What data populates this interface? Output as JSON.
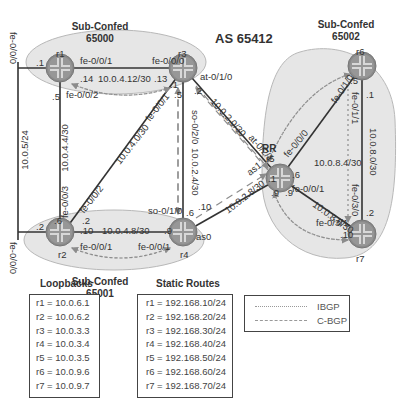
{
  "title": "AS 65412",
  "sub_confeds": [
    {
      "label": "Sub-Confed",
      "as": "65000"
    },
    {
      "label": "Sub-Confed",
      "as": "65001"
    },
    {
      "label": "Sub-Confed",
      "as": "65002"
    }
  ],
  "routers": [
    {
      "name": "r1"
    },
    {
      "name": "r2"
    },
    {
      "name": "r3"
    },
    {
      "name": "r4"
    },
    {
      "name": "r5",
      "role": "RR"
    },
    {
      "name": "r6"
    },
    {
      "name": "r7"
    }
  ],
  "links": {
    "shared": {
      "subnet": "10.0.5/24",
      "r1_if": "fe-0/0/0",
      "r2_if": "fe-0/0/0",
      "r1_host": ".1",
      "r2_host": ".2",
      "marker": "•"
    },
    "r1_r3": {
      "subnet": "10.0.4.12/30",
      "r1_if": "fe-0/0/1",
      "r3_if": "fe-0/0/0",
      "r1_host": ".14",
      "r3_host": ".13"
    },
    "r1_r2": {
      "subnet": "10.0.4.4/30",
      "r1_host": ".5",
      "r2_if": "fe-0/0/3",
      "r2_host": ".6"
    },
    "r1_ibgp_if": "fe-0/0/2",
    "r2_r3": {
      "subnet": "10.0.4.0/30",
      "r2_if": "fe-0/0/2",
      "r3_if": "fe-0/0/1",
      "r2_host": ".2",
      "r3_host": ".1"
    },
    "r2_r4": {
      "subnet": "10.0.4.8/30",
      "r2_if": "fe-0/0/1",
      "r4_if": "fe-0/0/1",
      "r2_host": ".10",
      "r4_host": ".9"
    },
    "r3_r4": {
      "subnet": "10.0.2.4/30",
      "r3_if": "so-0/2/0",
      "r4_if": "so-0/1/0",
      "r3_host": ".5",
      "r4_host": ".6"
    },
    "r3_r5": {
      "subnet": "10.0.2.0/30",
      "r3_if": "at-0/1/0",
      "r5_if": "at-0/2/1",
      "r3_host": ".2",
      "r5_host": ".1"
    },
    "r4_r5": {
      "subnet": "10.0.2.8/30",
      "r4_if": "as0",
      "r5_if": "as1",
      "r4_host": ".10",
      "r5_host": ".9"
    },
    "r5_r6": {
      "subnet": "10.0.8.4/30",
      "r5_if": "fe-0/0/0",
      "r6_if": "fe-0/1/0",
      "r5_host": ".6",
      "r6_host": ".5"
    },
    "r5_r7": {
      "subnet": "10.0.8.8/30",
      "r5_if": "fe-0/0/1",
      "r7_if": "fe-0/3/1",
      "r5_host": ".9",
      "r7_host": ".10"
    },
    "r6_r7": {
      "subnet": "10.0.8.0/30",
      "r6_if": "fe-0/1/1",
      "r7_if": "fe-0/3/0",
      "r6_host": ".1",
      "r7_host": ".2"
    }
  },
  "loopbacks": {
    "header": "Loopbacks",
    "rows": [
      "r1 = 10.0.6.1",
      "r2 = 10.0.6.2",
      "r3 = 10.0.3.3",
      "r4 = 10.0.3.4",
      "r5 = 10.0.3.5",
      "r6 = 10.0.9.6",
      "r7 = 10.0.9.7"
    ]
  },
  "static_routes": {
    "header": "Static Routes",
    "rows": [
      "r1 = 192.168.10/24",
      "r2 = 192.168.20/24",
      "r3 = 192.168.30/24",
      "r4 = 192.168.40/24",
      "r5 = 192.168.50/24",
      "r6 = 192.168.60/24",
      "r7 = 192.168.70/24"
    ]
  },
  "legend": {
    "items": [
      {
        "style": "dotted",
        "label": "IBGP"
      },
      {
        "style": "dashed",
        "label": "C-BGP"
      }
    ]
  },
  "colors": {
    "ellipse_fill": "#e6e6e6",
    "ellipse_stroke": "#b8b8b8",
    "router_fill": "#8a8a8a",
    "link": "#333333",
    "bgp": "#8c8c8c"
  }
}
